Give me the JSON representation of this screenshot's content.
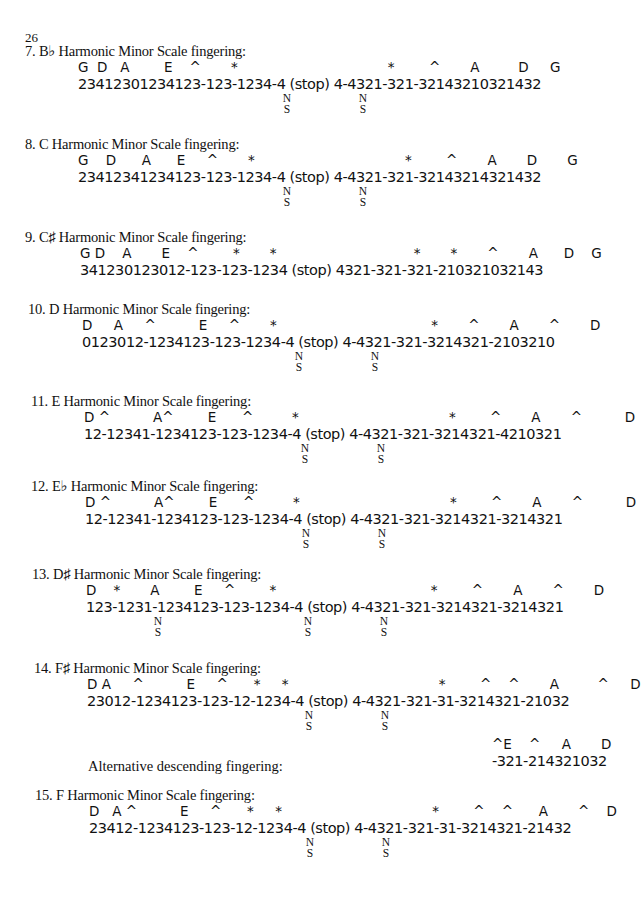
{
  "page_number": "26",
  "sections": [
    {
      "heading": "7. B♭ Harmonic Minor Scale fingering:",
      "notes": "G  D   A        E    ^       *                                   *        ^       A         D     G",
      "fingering": "23412301234123-123-1234-4 (stop) 4-4321-321-32143210321432",
      "ns_marks": [
        {
          "label_n": "N",
          "label_s": "S"
        },
        {
          "label_n": "N",
          "label_s": "S"
        }
      ]
    },
    {
      "heading": "8. C Harmonic Minor Scale fingering:",
      "notes": "G    D      A      E     ^       *                                   *        ^       A       D       G",
      "fingering": "23412341234123-123-1234-4 (stop) 4-4321-321-32143214321432",
      "ns_marks": [
        {
          "label_n": "N",
          "label_s": "S"
        },
        {
          "label_n": "N",
          "label_s": "S"
        }
      ]
    },
    {
      "heading": "9. C♯ Harmonic Minor Scale fingering:",
      "notes": "G D    A       E    ^        *       *                                *       *       ^       A      D    G",
      "fingering": "341230123012-123-123-1234 (stop) 4321-321-321-210321032143",
      "ns_marks": []
    },
    {
      "heading": "10. D Harmonic Minor Scale fingering:",
      "notes": "D     A     ^          E     ^       *                                    *       ^       A       ^       D",
      "fingering": "0123012-1234123-123-1234-4 (stop) 4-4321-321-3214321-2103210",
      "ns_marks": [
        {
          "label_n": "N",
          "label_s": "S"
        },
        {
          "label_n": "N",
          "label_s": "S"
        }
      ]
    },
    {
      "heading": "11. E Harmonic Minor Scale fingering:",
      "notes": "D ^          A^        E      ^         *                                   *        ^       A       ^          D",
      "fingering": "12-12341-1234123-123-1234-4 (stop) 4-4321-321-3214321-4210321",
      "ns_marks": [
        {
          "label_n": "N",
          "label_s": "S"
        },
        {
          "label_n": "N",
          "label_s": "S"
        }
      ]
    },
    {
      "heading": "12. E♭ Harmonic Minor Scale fingering:",
      "notes": "D ^          A^        E      ^         *                                   *        ^       A       ^          D",
      "fingering": "12-12341-1234123-123-1234-4 (stop) 4-4321-321-3214321-3214321",
      "ns_marks": [
        {
          "label_n": "N",
          "label_s": "S"
        },
        {
          "label_n": "N",
          "label_s": "S"
        }
      ]
    },
    {
      "heading": "13. D♯ Harmonic Minor Scale fingering:",
      "notes": "D    *       A        E     ^        *                                    *        ^       A       ^       D",
      "fingering": "123-1231-1234123-123-1234-4 (stop) 4-4321-321-3214321-3214321",
      "ns_marks": [
        {
          "label_n": "N",
          "label_s": "S"
        },
        {
          "label_n": "N",
          "label_s": "S"
        },
        {
          "label_n": "N",
          "label_s": "S"
        }
      ]
    },
    {
      "heading": "14. F♯ Harmonic Minor Scale fingering:",
      "notes": "D A     ^          E     ^      *     *                                   *        ^    ^       A         ^     D",
      "fingering": "23012-1234123-123-12-1234-4 (stop) 4-4321-321-31-3214321-21032",
      "ns_marks": [
        {
          "label_n": "N",
          "label_s": "S"
        },
        {
          "label_n": "N",
          "label_s": "S"
        }
      ],
      "alternative": {
        "label": "Alternative descending fingering:",
        "notes": "^E    ^     A       D",
        "fingering": "-321-214321032"
      }
    },
    {
      "heading": "15. F Harmonic Minor Scale fingering:",
      "notes": "D   A ^          E     ^      *     *                                   *        ^    ^      A       ^    D",
      "fingering": "23412-1234123-123-12-1234-4 (stop) 4-4321-321-31-3214321-21432",
      "ns_marks": [
        {
          "label_n": "N",
          "label_s": "S"
        },
        {
          "label_n": "N",
          "label_s": "S"
        }
      ]
    }
  ]
}
